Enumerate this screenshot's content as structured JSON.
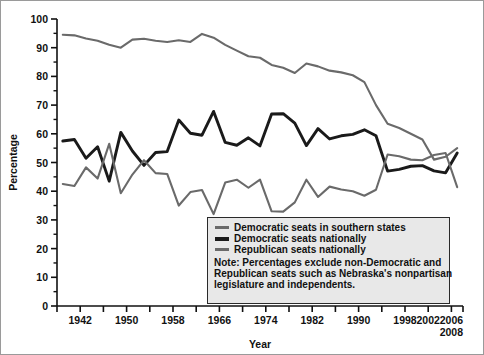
{
  "chart_data": {
    "type": "line",
    "title": "",
    "xlabel": "Year",
    "ylabel": "Percentage",
    "xlim": [
      1938,
      2008
    ],
    "ylim": [
      0,
      100
    ],
    "ytick_step": 10,
    "yticks": [
      0,
      10,
      20,
      30,
      40,
      50,
      60,
      70,
      80,
      90,
      100
    ],
    "ytick_labels": [
      "0",
      "10",
      "20",
      "30",
      "40",
      "50",
      "60",
      "70",
      "80",
      "90",
      "100"
    ],
    "y_minor_step": 5,
    "xticks": [
      1938,
      1942,
      1946,
      1950,
      1954,
      1958,
      1962,
      1966,
      1970,
      1974,
      1978,
      1982,
      1986,
      1990,
      1994,
      1998,
      2002,
      2006,
      2008
    ],
    "xtick_labels": [
      "1942",
      "1950",
      "1958",
      "1966",
      "1974",
      "1982",
      "1990",
      "1998",
      "2002",
      "2006",
      "2008"
    ],
    "xtick_label_years": [
      1942,
      1950,
      1958,
      1966,
      1974,
      1982,
      1990,
      1998,
      2002,
      2006,
      2008
    ],
    "grid": false,
    "legend_position": "inside-bottom-right",
    "x": [
      1939,
      1941,
      1943,
      1945,
      1947,
      1949,
      1951,
      1953,
      1955,
      1957,
      1959,
      1961,
      1963,
      1965,
      1967,
      1969,
      1971,
      1973,
      1975,
      1977,
      1979,
      1981,
      1983,
      1985,
      1987,
      1989,
      1991,
      1993,
      1995,
      1997,
      1999,
      2001,
      2003,
      2005,
      2007
    ],
    "series": [
      {
        "name": "Democratic seats in southern states",
        "color": "#6a6a6a",
        "width": 2.1,
        "values": [
          94.5,
          94.3,
          93.2,
          92.4,
          91.0,
          90.0,
          92.8,
          93.1,
          92.4,
          92.0,
          92.6,
          92.0,
          94.8,
          93.5,
          91.0,
          89.0,
          87.0,
          86.5,
          84.0,
          83.0,
          81.2,
          84.5,
          83.5,
          82.0,
          81.4,
          80.4,
          78.0,
          70.0,
          63.5,
          62.0,
          60.0,
          58.0,
          51.0,
          52.0,
          55.0
        ]
      },
      {
        "name": "Democratic seats nationally",
        "color": "#1a1a1a",
        "width": 2.9,
        "values": [
          57.5,
          58.0,
          51.5,
          55.5,
          43.5,
          60.5,
          54.0,
          49.0,
          53.5,
          53.8,
          64.8,
          60.2,
          59.5,
          67.8,
          57.0,
          56.0,
          58.6,
          55.8,
          66.9,
          67.0,
          63.7,
          55.9,
          61.8,
          58.2,
          59.3,
          59.8,
          61.4,
          59.3,
          47.0,
          47.6,
          48.7,
          48.9,
          47.1,
          46.4,
          53.3
        ]
      },
      {
        "name": "Republican seats nationally",
        "color": "#6a6a6a",
        "width": 2.1,
        "values": [
          42.5,
          41.8,
          48.3,
          44.4,
          56.5,
          39.3,
          45.8,
          50.8,
          46.3,
          46.0,
          35.0,
          39.7,
          40.4,
          32.0,
          43.0,
          44.0,
          41.2,
          44.0,
          33.0,
          32.9,
          36.1,
          44.0,
          38.0,
          41.6,
          40.6,
          40.0,
          38.4,
          40.5,
          52.8,
          52.2,
          51.0,
          50.8,
          52.6,
          53.3,
          41.4
        ]
      }
    ]
  },
  "legend": {
    "entries": [
      {
        "label": "Democratic seats in southern states",
        "color": "#6a6a6a",
        "weight": "thin"
      },
      {
        "label": "Democratic seats nationally",
        "color": "#1a1a1a",
        "weight": "thick"
      },
      {
        "label": "Republican seats nationally",
        "color": "#6a6a6a",
        "weight": "thin"
      }
    ],
    "note_lines": [
      "Note: Percentages exclude non-Democratic and",
      "Republican seats such as Nebraska's nonpartisan",
      "legislature and independents."
    ]
  }
}
